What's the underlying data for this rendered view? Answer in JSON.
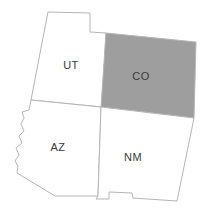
{
  "map": {
    "title": "Four Corners states map",
    "background_color": "#ffffff",
    "default_fill": "#ffffff",
    "highlight_fill": "#9e9e9e",
    "border_color": "#b5b5b5",
    "label_color": "#3a3a3a",
    "states": [
      {
        "code": "UT",
        "name": "Utah",
        "highlighted": false,
        "fill": "#ffffff",
        "label_x": 71,
        "label_y": 66,
        "outline": "M48,12 L90,13 L90,32 L106,33 L102,107 L31,100 L41,48 Z"
      },
      {
        "code": "CO",
        "name": "Colorado",
        "highlighted": true,
        "fill": "#9e9e9e",
        "label_x": 141,
        "label_y": 77,
        "outline": "M106,33 L196,42 L194,118 L101,107 Z"
      },
      {
        "code": "AZ",
        "name": "Arizona",
        "highlighted": false,
        "fill": "#ffffff",
        "label_x": 58,
        "label_y": 148,
        "outline": "M31,100 L101,107 L98,196 L55,196 L17,173 L18,166 L15,161 L19,155 L16,148 L22,143 L19,136 L24,131 L21,124 L24,118 L22,112 L29,110 Z"
      },
      {
        "code": "NM",
        "name": "New Mexico",
        "highlighted": false,
        "fill": "#ffffff",
        "label_x": 133,
        "label_y": 158,
        "outline": "M101,107 L194,118 L177,201 L133,198 L132,193 L109,192 L109,199 L96,199 L98,196 Z"
      }
    ]
  }
}
